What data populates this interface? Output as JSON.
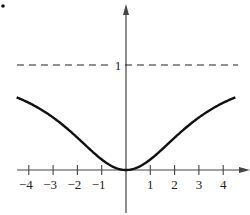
{
  "chart_data": {
    "type": "line",
    "title": "",
    "xlabel": "",
    "ylabel": "",
    "function": "y = x^2 / (x^2 + 9)",
    "xlim": [
      -4.6,
      4.8
    ],
    "ylim": [
      0,
      1.0
    ],
    "x_ticks": [
      -4,
      -3,
      -2,
      -1,
      1,
      2,
      3,
      4
    ],
    "x_tick_labels": [
      "−4",
      "−3",
      "−2",
      "−1",
      "1",
      "2",
      "3",
      "4"
    ],
    "y_tick_labels": [
      "1"
    ],
    "asymptote": {
      "y": 1,
      "style": "dashed",
      "label": "1"
    },
    "series": [
      {
        "name": "f(x)",
        "x": [
          -4.5,
          -4,
          -3,
          -2,
          -1,
          0,
          1,
          2,
          3,
          4,
          4.5
        ],
        "values": [
          0.69,
          0.64,
          0.5,
          0.31,
          0.1,
          0,
          0.1,
          0.31,
          0.5,
          0.64,
          0.69
        ]
      }
    ],
    "grid": false,
    "legend": null
  },
  "marker": "•",
  "colors": {
    "curve": "#111111",
    "axis": "#444444",
    "dash": "#222222"
  }
}
